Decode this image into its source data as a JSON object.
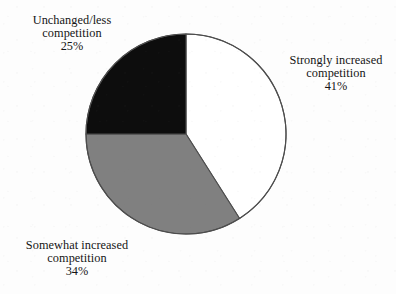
{
  "chart_data": {
    "type": "pie",
    "title": "",
    "subtitle": "",
    "xlabel": "",
    "ylabel": "",
    "legend_position": "none",
    "grid": false,
    "units": "percent",
    "start_angle_deg": 0,
    "direction": "clockwise",
    "categories": [
      "Strongly increased competition",
      "Somewhat increased competition",
      "Unchanged/less competition"
    ],
    "values": [
      41,
      34,
      25
    ],
    "slices": [
      {
        "name": "strongly-increased-competition",
        "label_line1": "Strongly increased",
        "label_line2": "competition",
        "value": 41,
        "value_text": "41%",
        "color": "#ffffff",
        "stroke": "#4d4d4d",
        "start_deg": 0,
        "end_deg": 147.6
      },
      {
        "name": "somewhat-increased-competition",
        "label_line1": "Somewhat increased",
        "label_line2": "competition",
        "value": 34,
        "value_text": "34%",
        "color": "#808080",
        "stroke": "#4d4d4d",
        "start_deg": 147.6,
        "end_deg": 270.0
      },
      {
        "name": "unchanged-less-competition",
        "label_line1": "Unchanged/less",
        "label_line2": "competition",
        "value": 25,
        "value_text": "25%",
        "color": "#0d0d0d",
        "stroke": "#4d4d4d",
        "start_deg": 270.0,
        "end_deg": 360.0
      }
    ]
  },
  "colors": {
    "background": "#fdfdfd",
    "text": "#151515",
    "outline": "#4d4d4d",
    "slice_white": "#ffffff",
    "slice_gray": "#808080",
    "slice_black": "#0d0d0d"
  },
  "geometry": {
    "center_x": 186,
    "center_y": 134,
    "radius": 100
  }
}
